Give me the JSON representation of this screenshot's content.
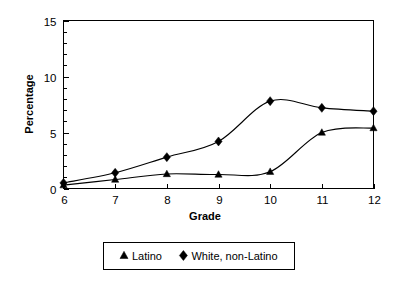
{
  "chart_data": {
    "type": "line",
    "title": "",
    "subtitle": "",
    "xlabel": "Grade",
    "ylabel": "Percentage",
    "x": [
      6,
      7,
      8,
      9,
      10,
      11,
      12
    ],
    "xtick_labels": [
      "6",
      "7",
      "8",
      "9",
      "10",
      "11",
      "12"
    ],
    "ytick_labels": [
      "0",
      "5",
      "10",
      "15"
    ],
    "ytick_values": [
      0,
      5,
      10,
      15
    ],
    "xlim": [
      6,
      12
    ],
    "ylim": [
      0,
      15
    ],
    "y_minor_tick_interval": 1,
    "grid": false,
    "smoothed": true,
    "legend_position": "below-axes-center",
    "series": [
      {
        "name": "Latino",
        "marker": "triangle",
        "color": "#000000",
        "values": [
          0.3,
          0.8,
          1.3,
          1.25,
          1.5,
          5.0,
          5.4
        ]
      },
      {
        "name": "White, non-Latino",
        "marker": "diamond",
        "color": "#000000",
        "values": [
          0.5,
          1.4,
          2.8,
          4.2,
          7.8,
          7.2,
          6.9
        ]
      }
    ]
  },
  "legend": {
    "entries": [
      {
        "label": "Latino",
        "marker": "triangle-marker-icon"
      },
      {
        "label": "White, non-Latino",
        "marker": "diamond-marker-icon"
      }
    ]
  },
  "axes": {
    "x_title": "Grade",
    "y_title": "Percentage"
  }
}
